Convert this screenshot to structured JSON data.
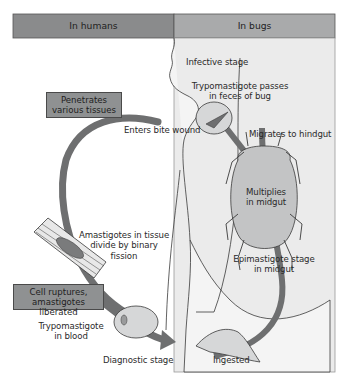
{
  "header": {
    "left_label": "In humans",
    "right_label": "In bugs",
    "left_color": "#8a8b8c",
    "right_color": "#a9aaab"
  },
  "colors": {
    "bug_panel": "#ebebeb",
    "arrow": "#6e6f70",
    "outline": "#3a3a3a",
    "label_box": "#8f9192"
  },
  "boxes": {
    "penetrates": [
      "Penetrates",
      "various tissues"
    ],
    "cell_ruptures": [
      "Cell ruptures,",
      "amastigotes liberated"
    ]
  },
  "labels": {
    "infective_stage": "Infective stage",
    "trypo_feces": [
      "Trypomastigote passes",
      "in feces of bug"
    ],
    "enters_bite": "Enters bite wound",
    "migrates_hindgut": "Migrates to hindgut",
    "multiplies_midgut": [
      "Multiplies",
      "in midgut"
    ],
    "amastigotes_tissue": [
      "Amastigotes in tissue",
      "divide by binary",
      "fission"
    ],
    "epimastigote": [
      "Epimastigote stage",
      "in midgut"
    ],
    "trypo_blood": [
      "Trypomastigote",
      "in blood"
    ],
    "diagnostic_stage": "Diagnostic stage",
    "ingested": "Ingested"
  }
}
